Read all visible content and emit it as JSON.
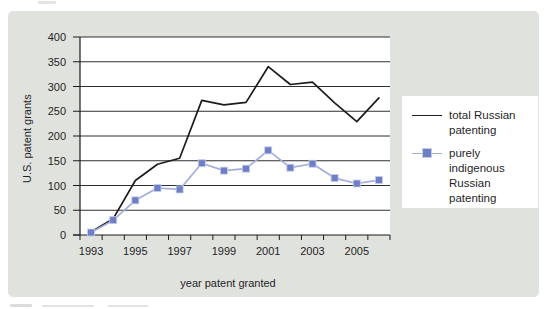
{
  "figure": {
    "panel_bg": "#e0e2de",
    "plot_bg": "#ffffff",
    "gridline_color": "#2f2f2f",
    "axis_color": "#1c1c1c",
    "text_color": "#1f1f1f"
  },
  "chart_data": {
    "type": "line",
    "title": "",
    "xlabel": "year patent granted",
    "ylabel": "U.S. patent grants",
    "categories": [
      1993,
      1994,
      1995,
      1996,
      1997,
      1998,
      1999,
      2000,
      2001,
      2002,
      2003,
      2004,
      2005,
      2006
    ],
    "x_tick_labels": [
      "1993",
      "1995",
      "1997",
      "1999",
      "2001",
      "2003",
      "2005"
    ],
    "y_tick_labels": [
      "0",
      "50",
      "100",
      "150",
      "200",
      "250",
      "300",
      "350",
      "400"
    ],
    "ylim": [
      0,
      400
    ],
    "ytick_interval": 50,
    "grid": "horizontal",
    "legend_position": "right-outside",
    "series": [
      {
        "name": "total Russian patenting",
        "color": "#1c1c1c",
        "marker": "none",
        "values": [
          6,
          33,
          110,
          143,
          155,
          272,
          263,
          268,
          340,
          304,
          309,
          267,
          229,
          277
        ]
      },
      {
        "name": "purely indigenous Russian patenting",
        "color": "#a2addc",
        "marker": "square",
        "marker_color": "#6f7fc6",
        "values": [
          5,
          30,
          70,
          95,
          92,
          145,
          130,
          134,
          171,
          136,
          144,
          115,
          104,
          111
        ]
      }
    ]
  },
  "legend": {
    "items": [
      {
        "label": "total Russian patenting",
        "swatch": "line",
        "color": "#1c1c1c"
      },
      {
        "label": "purely indigenous Russian patenting",
        "swatch": "line-square-marker",
        "color": "#a2addc",
        "marker_color": "#6f7fc6"
      }
    ]
  }
}
